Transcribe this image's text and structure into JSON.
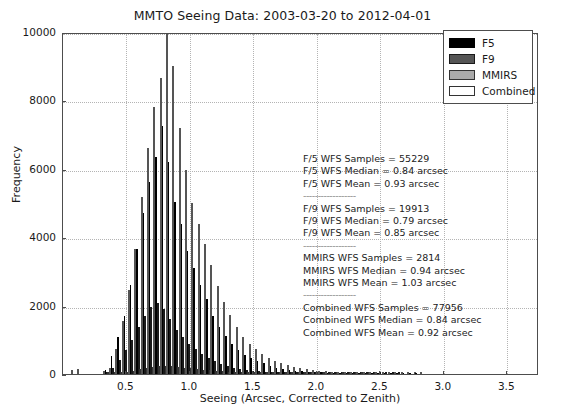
{
  "chart_data": {
    "type": "bar",
    "title": "MMTO Seeing Data: 2003-03-20 to 2012-04-01",
    "xlabel": "Seeing (Arcsec, Corrected to Zenith)",
    "ylabel": "Frequency",
    "xlim": [
      0.0,
      3.75
    ],
    "ylim": [
      0,
      10000
    ],
    "grid": true,
    "legend_position": "upper right",
    "bin_width": 0.05,
    "xticks": [
      0.5,
      1.0,
      1.5,
      2.0,
      2.5,
      3.0,
      3.5
    ],
    "xtick_labels": [
      "0.5",
      "1.0",
      "1.5",
      "2.0",
      "2.5",
      "3.0",
      "3.5"
    ],
    "yticks": [
      0,
      2000,
      4000,
      6000,
      8000,
      10000
    ],
    "ytick_labels": [
      "0",
      "2000",
      "4000",
      "6000",
      "8000",
      "10000"
    ],
    "colors": {
      "F5": "#000000",
      "F9": "#555555",
      "MMIRS": "#aaaaaa",
      "Combined": "#ffffff"
    },
    "x": [
      0.05,
      0.1,
      0.15,
      0.2,
      0.25,
      0.3,
      0.35,
      0.4,
      0.45,
      0.5,
      0.55,
      0.6,
      0.65,
      0.7,
      0.75,
      0.8,
      0.85,
      0.9,
      0.95,
      1.0,
      1.05,
      1.1,
      1.15,
      1.2,
      1.25,
      1.3,
      1.35,
      1.4,
      1.45,
      1.5,
      1.55,
      1.6,
      1.65,
      1.7,
      1.75,
      1.8,
      1.85,
      1.9,
      1.95,
      2.0,
      2.05,
      2.1,
      2.15,
      2.2,
      2.25,
      2.3,
      2.35,
      2.4,
      2.45,
      2.5,
      2.55,
      2.6,
      2.65,
      2.7,
      2.75,
      2.8
    ],
    "series": [
      {
        "name": "F5",
        "color": "#000000",
        "values": [
          0,
          0,
          0,
          0,
          0,
          0,
          120,
          520,
          1080,
          1700,
          2590,
          3660,
          4710,
          5620,
          6350,
          7250,
          6200,
          5030,
          4400,
          3600,
          3100,
          2600,
          2180,
          1700,
          1380,
          1120,
          880,
          700,
          560,
          470,
          380,
          310,
          240,
          190,
          150,
          120,
          100,
          85,
          70,
          60,
          48,
          40,
          32,
          26,
          20,
          16,
          12,
          10,
          8,
          6,
          5,
          4,
          3,
          2,
          2,
          1
        ]
      },
      {
        "name": "F9",
        "color": "#555555",
        "values": [
          0,
          0,
          0,
          0,
          0,
          0,
          40,
          190,
          420,
          690,
          980,
          1380,
          1700,
          1950,
          2080,
          1900,
          1620,
          1300,
          1080,
          880,
          720,
          590,
          470,
          380,
          300,
          240,
          190,
          150,
          120,
          95,
          78,
          62,
          50,
          40,
          32,
          26,
          21,
          17,
          14,
          11,
          9,
          7,
          6,
          5,
          4,
          3,
          3,
          2,
          2,
          1,
          1,
          1,
          1,
          0,
          0,
          0
        ]
      },
      {
        "name": "MMIRS",
        "color": "#aaaaaa",
        "values": [
          0,
          0,
          0,
          0,
          0,
          0,
          4,
          18,
          38,
          62,
          96,
          140,
          180,
          210,
          230,
          240,
          230,
          210,
          190,
          170,
          150,
          130,
          115,
          98,
          84,
          72,
          60,
          50,
          42,
          35,
          29,
          24,
          20,
          16,
          13,
          11,
          9,
          7,
          6,
          5,
          4,
          3,
          3,
          2,
          2,
          1,
          1,
          1,
          1,
          0,
          0,
          0,
          0,
          0,
          0,
          0
        ]
      },
      {
        "name": "Combined",
        "color": "#ffffff",
        "values": [
          130,
          160,
          0,
          0,
          0,
          90,
          170,
          730,
          1540,
          2450,
          3670,
          5180,
          6600,
          7800,
          8650,
          10000,
          9000,
          7200,
          5960,
          5000,
          4400,
          3800,
          3200,
          2560,
          2100,
          1720,
          1380,
          1090,
          880,
          720,
          590,
          480,
          390,
          320,
          260,
          210,
          175,
          145,
          120,
          100,
          80,
          65,
          52,
          42,
          34,
          26,
          20,
          16,
          13,
          10,
          8,
          6,
          5,
          4,
          3,
          2
        ]
      }
    ]
  },
  "legend": {
    "entries": [
      {
        "label": "F5"
      },
      {
        "label": "F9"
      },
      {
        "label": "MMIRS"
      },
      {
        "label": "Combined"
      }
    ]
  },
  "annotations": {
    "groups": [
      {
        "lines": [
          "F/5 WFS Samples = 55229",
          "F/5 WFS Median =  0.84 arcsec",
          "F/5 WFS Mean =  0.93 arcsec"
        ],
        "separator": "------------------"
      },
      {
        "lines": [
          "F/9 WFS Samples = 19913",
          "F/9 WFS Median =  0.79 arcsec",
          "F/9 WFS Mean =  0.85 arcsec"
        ],
        "separator": "------------------"
      },
      {
        "lines": [
          "MMIRS WFS Samples = 2814",
          "MMIRS WFS Median =  0.94 arcsec",
          "MMIRS WFS Mean =  1.03 arcsec"
        ],
        "separator": "------------------"
      },
      {
        "lines": [
          "Combined WFS Samples = 77956",
          "Combined WFS Median =  0.84 arcsec",
          "Combined WFS Mean =  0.92 arcsec"
        ],
        "separator": ""
      }
    ]
  }
}
